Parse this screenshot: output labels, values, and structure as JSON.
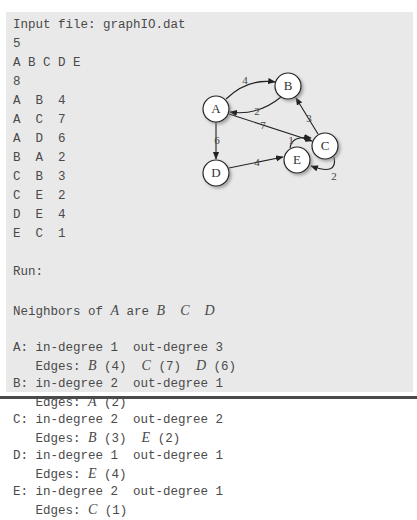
{
  "input": {
    "header": "Input file: graphIO.dat",
    "vertex_count": "5",
    "vertices": "A B C D E",
    "edge_count": "8",
    "edges": [
      {
        "from": "A",
        "to": "B",
        "weight": "4"
      },
      {
        "from": "A",
        "to": "C",
        "weight": "7"
      },
      {
        "from": "A",
        "to": "D",
        "weight": "6"
      },
      {
        "from": "B",
        "to": "A",
        "weight": "2"
      },
      {
        "from": "C",
        "to": "B",
        "weight": "3"
      },
      {
        "from": "C",
        "to": "E",
        "weight": "2"
      },
      {
        "from": "D",
        "to": "E",
        "weight": "4"
      },
      {
        "from": "E",
        "to": "C",
        "weight": "1"
      }
    ]
  },
  "run": {
    "label": "Run:",
    "neighbors_prefix": "Neighbors of ",
    "neighbors_vertex": "A",
    "neighbors_mid": " are ",
    "neighbors_list": [
      "B",
      "C",
      "D"
    ],
    "vertices": [
      {
        "name": "A",
        "in_degree": "1",
        "out_degree": "3",
        "edges": [
          {
            "to": "B",
            "w": "(4)"
          },
          {
            "to": "C",
            "w": "(7)"
          },
          {
            "to": "D",
            "w": "(6)"
          }
        ]
      },
      {
        "name": "B",
        "in_degree": "2",
        "out_degree": "1",
        "edges": [
          {
            "to": "A",
            "w": "(2)"
          }
        ]
      },
      {
        "name": "C",
        "in_degree": "2",
        "out_degree": "2",
        "edges": [
          {
            "to": "B",
            "w": "(3)"
          },
          {
            "to": "E",
            "w": "(2)"
          }
        ]
      },
      {
        "name": "D",
        "in_degree": "1",
        "out_degree": "1",
        "edges": [
          {
            "to": "E",
            "w": "(4)"
          }
        ]
      },
      {
        "name": "E",
        "in_degree": "2",
        "out_degree": "1",
        "edges": [
          {
            "to": "C",
            "w": "(1)"
          }
        ]
      }
    ],
    "in_degree_label": "in-degree",
    "out_degree_label": "out-degree",
    "edges_label": "Edges:"
  },
  "graph": {
    "nodes": [
      {
        "id": "A",
        "x": 216,
        "y": 109
      },
      {
        "id": "B",
        "x": 288,
        "y": 86
      },
      {
        "id": "C",
        "x": 325,
        "y": 146
      },
      {
        "id": "D",
        "x": 216,
        "y": 173
      },
      {
        "id": "E",
        "x": 297,
        "y": 160
      }
    ],
    "edge_labels": {
      "AB": "4",
      "BA": "2",
      "AC": "7",
      "AD": "6",
      "CB": "3",
      "CE": "2",
      "DE": "4",
      "EC": "1"
    }
  }
}
